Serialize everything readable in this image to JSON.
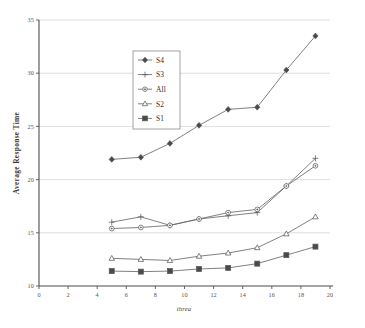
{
  "chart_data": {
    "type": "line",
    "title": "",
    "xlabel": "threa",
    "ylabel": "Average Response Time",
    "xlim": [
      0,
      20
    ],
    "ylim": [
      10,
      35
    ],
    "xticks": [
      0,
      2,
      4,
      6,
      8,
      10,
      12,
      14,
      16,
      18,
      20
    ],
    "yticks": [
      10,
      15,
      20,
      25,
      30,
      35
    ],
    "grid": "horizontal",
    "legend_position": "upper-left-inside",
    "x": [
      5,
      7,
      9,
      11,
      13,
      15,
      17,
      19
    ],
    "series": [
      {
        "name": "S4",
        "marker": "diamond",
        "values": [
          21.9,
          22.1,
          23.4,
          25.1,
          26.6,
          26.8,
          30.3,
          33.5
        ]
      },
      {
        "name": "S3",
        "marker": "plus",
        "values": [
          16.0,
          16.5,
          15.7,
          16.3,
          16.6,
          16.9,
          19.4,
          22.0
        ]
      },
      {
        "name": "All",
        "marker": "circle",
        "values": [
          15.4,
          15.5,
          15.7,
          16.3,
          16.9,
          17.2,
          19.4,
          21.3
        ]
      },
      {
        "name": "S2",
        "marker": "triangle",
        "values": [
          12.6,
          12.5,
          12.4,
          12.8,
          13.1,
          13.6,
          14.9,
          16.5
        ]
      },
      {
        "name": "S1",
        "marker": "square-filled",
        "values": [
          11.4,
          11.35,
          11.4,
          11.6,
          11.7,
          12.1,
          12.9,
          13.7
        ]
      }
    ],
    "legend": [
      "S4",
      "S3",
      "All",
      "S2",
      "S1"
    ],
    "colors": {
      "line": "#6a6a6a",
      "marker_stroke": "#5a5a5a",
      "marker_fill": "#ffffff",
      "marker_fill_solid": "#4a4a4a",
      "grid": "#c8c8d2",
      "axis": "#4d4d4d",
      "text": "#3a3a3a",
      "background": "#ffffff"
    }
  }
}
